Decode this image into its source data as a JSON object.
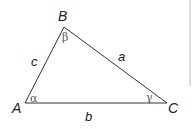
{
  "diagram": {
    "vertices": {
      "A": {
        "label": "A",
        "x": 25,
        "y": 103
      },
      "B": {
        "label": "B",
        "x": 64,
        "y": 27
      },
      "C": {
        "label": "C",
        "x": 167,
        "y": 103
      }
    },
    "sides": {
      "a": {
        "label": "a"
      },
      "b": {
        "label": "b"
      },
      "c": {
        "label": "c"
      }
    },
    "angles": {
      "alpha": {
        "label": "α"
      },
      "beta": {
        "label": "β"
      },
      "gamma": {
        "label": "γ"
      }
    },
    "colors": {
      "stroke": "#333333",
      "divider": "#bbbbbb"
    }
  }
}
